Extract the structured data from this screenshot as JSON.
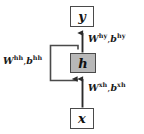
{
  "diagram": {
    "type": "rnn-unrolled-cell",
    "background_color": "#ffffff",
    "stroke_color": "#4a4a4a",
    "text_color": "#111111",
    "nodes": [
      {
        "id": "y",
        "label": "y",
        "role": "output-node",
        "fill": "#ffffff",
        "x": 70,
        "y": 6,
        "w": 24,
        "h": 21
      },
      {
        "id": "h",
        "label": "h",
        "role": "hidden-state-node",
        "fill": "#b8b8b8",
        "x": 70,
        "y": 53,
        "w": 26,
        "h": 20
      },
      {
        "id": "x",
        "label": "x",
        "role": "input-node",
        "fill": "#ffffff",
        "x": 70,
        "y": 108,
        "w": 24,
        "h": 21
      }
    ],
    "edges": [
      {
        "id": "x-to-h",
        "from": "x",
        "to": "h",
        "direction": "up",
        "label_id": "xh"
      },
      {
        "id": "h-to-y",
        "from": "h",
        "to": "y",
        "direction": "up",
        "label_id": "hy"
      },
      {
        "id": "h-to-h",
        "from": "h",
        "to": "h",
        "direction": "recurrent-loop-left",
        "label_id": "hh"
      }
    ],
    "labels": [
      {
        "id": "hy",
        "weight_symbol": "W",
        "weight_superscript": "hy",
        "bias_symbol": "b",
        "bias_superscript": "hy",
        "separator": ",",
        "text": "W hy , b hy"
      },
      {
        "id": "hh",
        "weight_symbol": "W",
        "weight_superscript": "hh",
        "bias_symbol": "b",
        "bias_superscript": "hh",
        "separator": ",",
        "text": "W hh , b hh"
      },
      {
        "id": "xh",
        "weight_symbol": "W",
        "weight_superscript": "xh",
        "bias_symbol": "b",
        "bias_superscript": "xh",
        "separator": ",",
        "text": "W xh , b xh"
      }
    ]
  }
}
